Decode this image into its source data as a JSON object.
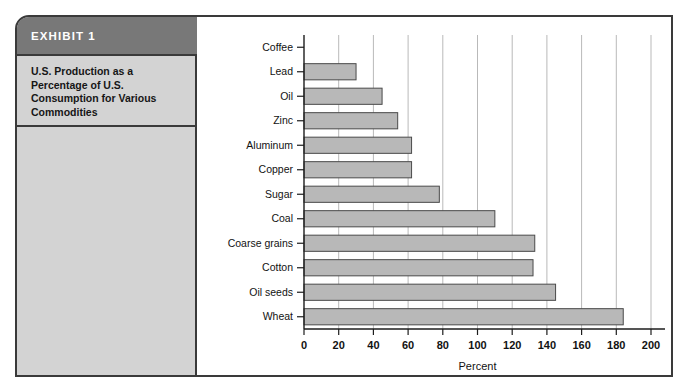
{
  "exhibit": {
    "badge": "EXHIBIT 1",
    "caption": "U.S. Production as a Percentage of U.S. Consumption for Various Commodities"
  },
  "chart_data": {
    "type": "bar",
    "orientation": "horizontal",
    "title": "U.S. Production as a Percentage of U.S. Consumption for Various Commodities",
    "xlabel": "Percent",
    "ylabel": "",
    "xlim": [
      0,
      200
    ],
    "xticks": [
      0,
      20,
      40,
      60,
      80,
      100,
      120,
      140,
      160,
      180,
      200
    ],
    "xticklabels": [
      "0",
      "20",
      "40",
      "60",
      "80",
      "100",
      "120",
      "140",
      "160",
      "180",
      "200"
    ],
    "grid": "vertical",
    "legend": "none",
    "categories": [
      "Coffee",
      "Lead",
      "Oil",
      "Zinc",
      "Aluminum",
      "Copper",
      "Sugar",
      "Coal",
      "Coarse grains",
      "Cotton",
      "Oil seeds",
      "Wheat"
    ],
    "values": [
      0,
      30,
      45,
      54,
      62,
      62,
      78,
      110,
      133,
      132,
      145,
      184
    ],
    "bar_color": "#b8b8b8",
    "bar_edge_color": "#4a4a4a"
  }
}
